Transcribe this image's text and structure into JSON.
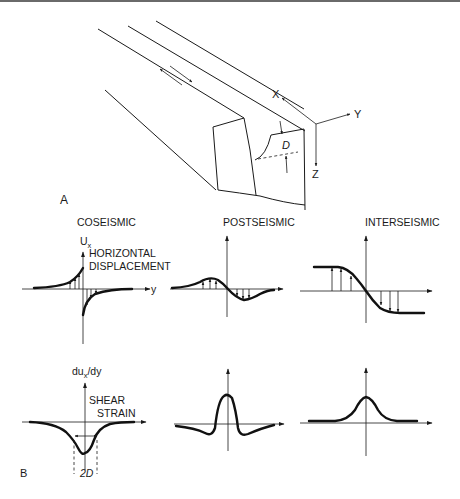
{
  "panel_a": {
    "label": "A",
    "axes": {
      "x": "X",
      "y": "Y",
      "z": "Z"
    },
    "depth_label": "D"
  },
  "panel_b": {
    "label": "B",
    "columns": [
      {
        "title": "COSEISMIC"
      },
      {
        "title": "POSTSEISMIC"
      },
      {
        "title": "INTERSEISMIC"
      }
    ],
    "displacement": {
      "ylabel_main": "U",
      "ylabel_sub": "x",
      "title_line1": "HORIZONTAL",
      "title_line2": "DISPLACEMENT",
      "xlabel": "y"
    },
    "strain": {
      "ylabel_pre": "du",
      "ylabel_sub": "x",
      "ylabel_post": "/dy",
      "title_line1": "SHEAR",
      "title_line2": "STRAIN",
      "width_label": "2D"
    }
  },
  "colors": {
    "ink": "#1a1a1a",
    "background": "#ffffff"
  }
}
